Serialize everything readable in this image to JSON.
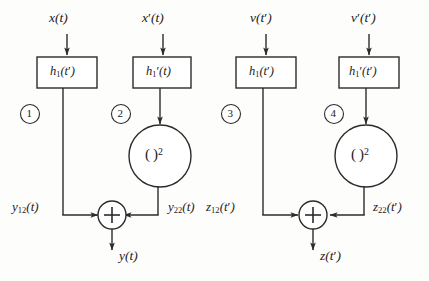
{
  "diagram": {
    "type": "signal-flow-block-diagram",
    "background_color": "#fdfdfc",
    "line_color": "#2b2b2b",
    "text_color": "#1b1b1b",
    "canvas": {
      "width": 429,
      "height": 281
    },
    "branches": [
      {
        "number": "①",
        "input_label": "x(t)",
        "block_label": "h₁(t′)",
        "has_squarer": false,
        "squarer_label": "",
        "output_label": "y₁₂(t)"
      },
      {
        "number": "②",
        "input_label": "x′(t)",
        "block_label": "h₁′(t)",
        "has_squarer": true,
        "squarer_label": "( )²",
        "output_label": "y₂₂(t)"
      },
      {
        "number": "③",
        "input_label": "v(t′)",
        "block_label": "h₁(t′)",
        "has_squarer": false,
        "squarer_label": "",
        "output_label": "z₁₂(t′)"
      },
      {
        "number": "④",
        "input_label": "v′(t′)",
        "block_label": "h₁′(t′)",
        "has_squarer": true,
        "squarer_label": "( )²",
        "output_label": "z₂₂(t′)"
      }
    ],
    "adders": [
      {
        "symbol": "+",
        "output_label": "y(t)"
      },
      {
        "symbol": "+",
        "output_label": "z(t′)"
      }
    ]
  }
}
